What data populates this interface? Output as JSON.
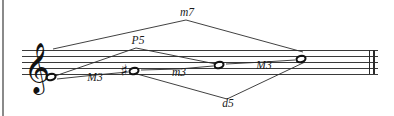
{
  "figure": {
    "background_color": "#ffffff",
    "ink_color": "#2b2b2b"
  },
  "staff": {
    "clef": "treble-clef",
    "clef_glyph": "𝄞",
    "line_count": 5,
    "line_top_y": 50,
    "line_spacing": 6,
    "left_x": 22,
    "right_x": 378,
    "barline_end": "double-barline"
  },
  "notes": [
    {
      "id": "note-1",
      "x": 51,
      "y": 77,
      "accidental": "",
      "accidental_glyph": ""
    },
    {
      "id": "note-2",
      "x": 134,
      "y": 71,
      "accidental": "sharp",
      "accidental_glyph": "♯"
    },
    {
      "id": "note-3",
      "x": 219,
      "y": 65,
      "accidental": "",
      "accidental_glyph": ""
    },
    {
      "id": "note-4",
      "x": 301,
      "y": 59,
      "accidental": "",
      "accidental_glyph": ""
    }
  ],
  "intervals": [
    {
      "id": "interval-m3-low-left",
      "label": "M3",
      "label_x": 95,
      "label_y": 81,
      "from_note": 1,
      "to_note": 2,
      "path": "M 57 79 L 95 75 L 128 72",
      "placement": "below-staff-inline"
    },
    {
      "id": "interval-m3-middle",
      "label": "m3",
      "label_x": 179,
      "label_y": 76,
      "from_note": 2,
      "to_note": 3,
      "path": "M 141 70 L 179 69 L 213 66",
      "placement": "inline"
    },
    {
      "id": "interval-M3-right",
      "label": "M3",
      "label_x": 264,
      "label_y": 69,
      "from_note": 3,
      "to_note": 4,
      "path": "M 226 64 L 264 62 L 295 60",
      "placement": "inline"
    },
    {
      "id": "interval-P5",
      "label": "P5",
      "label_x": 138,
      "label_y": 44,
      "from_note": 1,
      "to_note": 3,
      "path": "M 55 76 L 136 48 L 216 64",
      "placement": "above"
    },
    {
      "id": "interval-m7",
      "label": "m7",
      "label_x": 187,
      "label_y": 16,
      "from_note": 1,
      "to_note": 4,
      "path": "M 53 49 L 186 20 L 303 52",
      "placement": "above-outer"
    },
    {
      "id": "interval-d5",
      "label": "d5",
      "label_x": 228,
      "label_y": 107,
      "from_note": 2,
      "to_note": 4,
      "path": "M 137 74 L 227 99 L 305 62",
      "placement": "below"
    }
  ],
  "page_edge": {
    "x": 3,
    "visible": true
  }
}
